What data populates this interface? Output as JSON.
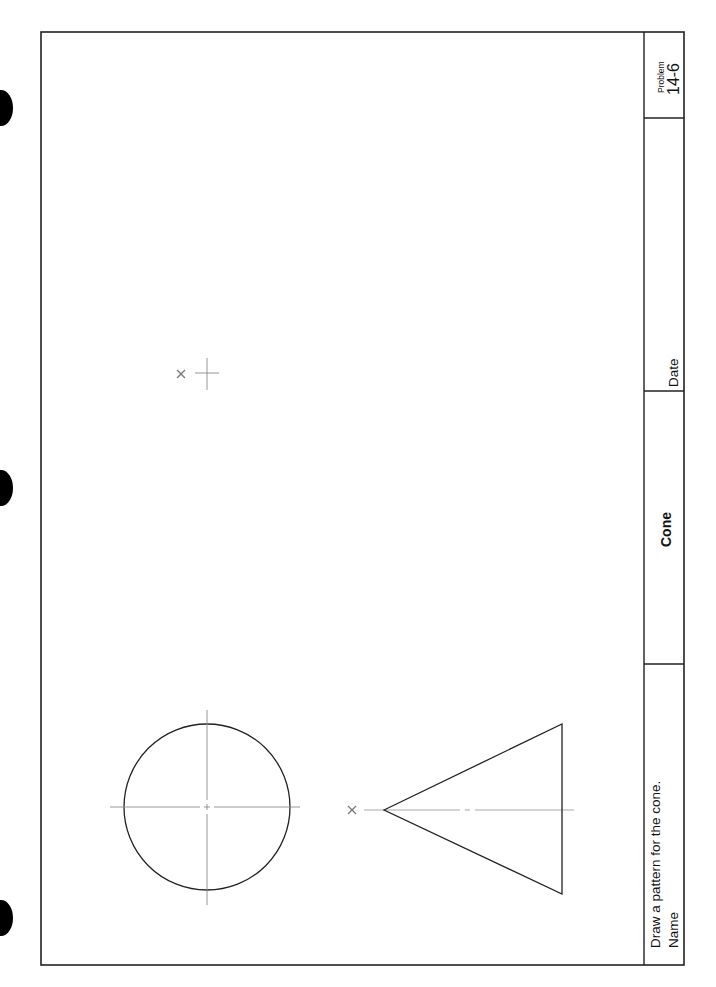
{
  "worksheet": {
    "instruction": "Draw a pattern for the cone.",
    "title_block": {
      "name_label": "Name",
      "title": "Cone",
      "date_label": "Date",
      "problem_label": "Problem",
      "problem_number": "14-6"
    },
    "drawings": {
      "top_view": "circle with center lines",
      "front_view": "triangle (cone elevation) with center line",
      "markers": [
        "x",
        "+",
        "x"
      ]
    }
  },
  "colors": {
    "ink": "#222222",
    "centerline": "#8a8a8a",
    "paper": "#ffffff"
  }
}
